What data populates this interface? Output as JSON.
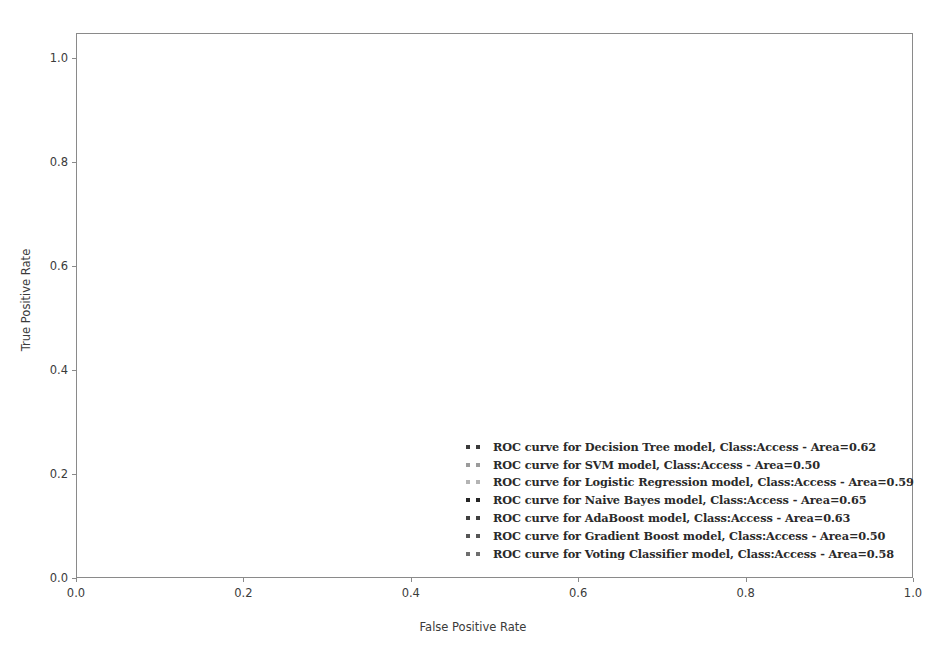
{
  "chart_data": {
    "type": "line",
    "title": "",
    "xlabel": "False Positive Rate",
    "ylabel": "True Positive Rate",
    "xlim": [
      0.0,
      1.0
    ],
    "ylim": [
      0.0,
      1.0
    ],
    "xticks": [
      "0.0",
      "0.2",
      "0.4",
      "0.6",
      "0.8",
      "1.0"
    ],
    "yticks": [
      "0.0",
      "0.2",
      "0.4",
      "0.6",
      "0.8",
      "1.0"
    ],
    "xtick_values": [
      0.0,
      0.2,
      0.4,
      0.6,
      0.8,
      1.0
    ],
    "ytick_values": [
      0.0,
      0.2,
      0.4,
      0.6,
      0.8,
      1.0
    ],
    "grid": false,
    "linestyle": "dotted",
    "legend_position": "lower right",
    "series": [
      {
        "name": "ROC curve for Decision Tree model, Class:Access - Area=0.62",
        "model": "Decision Tree",
        "class": "Access",
        "area": 0.62,
        "color": "#3a3a3a",
        "x": [
          0.0,
          0.05,
          0.1,
          0.15,
          0.2,
          0.25,
          0.3,
          0.35,
          0.4,
          0.45,
          0.5,
          0.55,
          0.6,
          0.63,
          0.7,
          0.75,
          0.8,
          0.85,
          0.9,
          0.95,
          1.0
        ],
        "y": [
          0.0,
          0.09,
          0.17,
          0.25,
          0.33,
          0.4,
          0.47,
          0.54,
          0.61,
          0.68,
          0.74,
          0.8,
          0.86,
          0.88,
          0.91,
          0.93,
          0.95,
          0.96,
          0.97,
          0.985,
          1.0
        ]
      },
      {
        "name": "ROC curve for SVM model, Class:Access - Area=0.50",
        "model": "SVM",
        "class": "Access",
        "area": 0.5,
        "color": "#9b9b9b",
        "x": [
          0.0,
          0.1,
          0.2,
          0.3,
          0.4,
          0.5,
          0.6,
          0.7,
          0.8,
          0.9,
          1.0
        ],
        "y": [
          0.0,
          0.1,
          0.2,
          0.3,
          0.4,
          0.5,
          0.6,
          0.7,
          0.8,
          0.9,
          1.0
        ]
      },
      {
        "name": "ROC curve for Logistic Regression model, Class:Access - Area=0.59",
        "model": "Logistic Regression",
        "class": "Access",
        "area": 0.59,
        "color": "#b4b4b4",
        "x": [
          0.0,
          0.05,
          0.1,
          0.15,
          0.2,
          0.25,
          0.3,
          0.35,
          0.4,
          0.45,
          0.5,
          0.55,
          0.6,
          0.65,
          0.7,
          0.75,
          0.8,
          0.85,
          0.9,
          0.95,
          1.0
        ],
        "y": [
          0.0,
          0.07,
          0.14,
          0.21,
          0.28,
          0.35,
          0.42,
          0.48,
          0.54,
          0.6,
          0.66,
          0.71,
          0.76,
          0.81,
          0.86,
          0.9,
          0.93,
          0.955,
          0.975,
          0.99,
          1.0
        ]
      },
      {
        "name": "ROC curve for Naive Bayes model, Class:Access - Area=0.65",
        "model": "Naive Bayes",
        "class": "Access",
        "area": 0.65,
        "color": "#262626",
        "x": [
          0.0,
          0.05,
          0.1,
          0.15,
          0.2,
          0.25,
          0.3,
          0.35,
          0.4,
          0.45,
          0.5,
          0.55,
          0.6,
          0.63,
          0.68,
          0.72,
          0.78,
          0.85,
          0.9,
          0.95,
          1.0
        ],
        "y": [
          0.0,
          0.1,
          0.19,
          0.28,
          0.37,
          0.45,
          0.53,
          0.61,
          0.68,
          0.75,
          0.82,
          0.88,
          0.93,
          0.945,
          0.955,
          0.962,
          0.97,
          0.978,
          0.985,
          0.993,
          1.0
        ]
      },
      {
        "name": "ROC curve for AdaBoost model, Class:Access - Area=0.63",
        "model": "AdaBoost",
        "class": "Access",
        "area": 0.63,
        "color": "#3f3f3f",
        "x": [
          0.0,
          0.05,
          0.1,
          0.15,
          0.2,
          0.25,
          0.3,
          0.35,
          0.4,
          0.45,
          0.5,
          0.55,
          0.6,
          0.65,
          0.7,
          0.75,
          0.8,
          0.85,
          0.9,
          0.95,
          1.0
        ],
        "y": [
          0.0,
          0.085,
          0.16,
          0.235,
          0.31,
          0.385,
          0.455,
          0.525,
          0.595,
          0.66,
          0.72,
          0.78,
          0.835,
          0.875,
          0.91,
          0.935,
          0.955,
          0.97,
          0.982,
          0.992,
          1.0
        ]
      },
      {
        "name": "ROC curve for Gradient Boost model, Class:Access - Area=0.50",
        "model": "Gradient Boost",
        "class": "Access",
        "area": 0.5,
        "color": "#555555",
        "x": [
          0.0,
          0.1,
          0.2,
          0.3,
          0.4,
          0.5,
          0.6,
          0.7,
          0.8,
          0.9,
          1.0
        ],
        "y": [
          0.0,
          0.055,
          0.115,
          0.175,
          0.24,
          0.31,
          0.39,
          0.49,
          0.6,
          0.75,
          1.0
        ]
      },
      {
        "name": "ROC curve for Voting Classifier model, Class:Access - Area=0.58",
        "model": "Voting Classifier",
        "class": "Access",
        "area": 0.58,
        "color": "#6e6e6e",
        "x": [
          0.0,
          0.05,
          0.1,
          0.15,
          0.2,
          0.25,
          0.3,
          0.35,
          0.4,
          0.45,
          0.5,
          0.55,
          0.6,
          0.65,
          0.7,
          0.75,
          0.8,
          0.85,
          0.9,
          0.95,
          1.0
        ],
        "y": [
          0.0,
          0.065,
          0.13,
          0.195,
          0.26,
          0.325,
          0.39,
          0.45,
          0.51,
          0.57,
          0.63,
          0.685,
          0.74,
          0.79,
          0.84,
          0.885,
          0.92,
          0.95,
          0.972,
          0.988,
          1.0
        ]
      }
    ]
  },
  "axes": {
    "xlabel": "False Positive Rate",
    "ylabel": "True Positive Rate"
  }
}
